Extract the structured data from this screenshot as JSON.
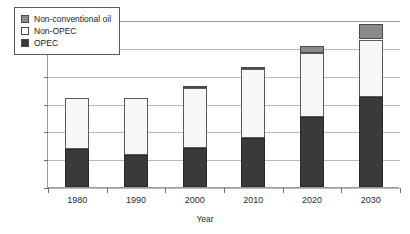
{
  "chart_data": {
    "type": "bar",
    "title": "",
    "subtitle": "",
    "xlabel": "Year",
    "ylabel": "Million Barrels per Day",
    "categories": [
      "1980",
      "1990",
      "2000",
      "2010",
      "2020",
      "2030"
    ],
    "series": [
      {
        "name": "OPEC",
        "values": [
          27,
          23,
          28,
          35.5,
          50,
          65
        ],
        "color": "#3a3a3a"
      },
      {
        "name": "Non-OPEC",
        "values": [
          37,
          41,
          43.5,
          49,
          46,
          41
        ],
        "color": "#f7f7f5"
      },
      {
        "name": "Non-conventional oil",
        "values": [
          0,
          0,
          0.8,
          1.3,
          5,
          11
        ],
        "color": "#8a8a8a"
      }
    ],
    "totals": [
      64,
      64,
      72.3,
      86.3,
      101,
      117
    ],
    "stacked": true,
    "ylim": [
      0,
      120
    ],
    "yticks": [
      0,
      20,
      40,
      60,
      80,
      100,
      120
    ],
    "ytick_labels": [
      "0",
      "20",
      "40",
      "60",
      "80",
      "100",
      "120"
    ],
    "xtick_labels": [
      "1980",
      "1990",
      "2000",
      "2010",
      "2020",
      "2030"
    ],
    "grid": true,
    "legend_position": "upper-left-inside",
    "legend_entries": [
      {
        "label": "Non-conventional oil",
        "swatch": "nonconv"
      },
      {
        "label": "Non-OPEC",
        "swatch": "nonopec"
      },
      {
        "label": "OPEC",
        "swatch": "opec"
      }
    ],
    "colors": {
      "opec": "#3a3a3a",
      "non_opec": "#f7f7f5",
      "non_conventional": "#8a8a8a",
      "axis": "#9a9a9a",
      "gridline": "#b9b9b9",
      "background": "#ffffff"
    }
  }
}
